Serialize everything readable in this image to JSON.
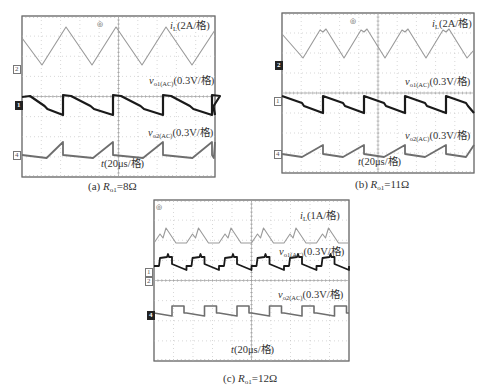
{
  "figure": {
    "panels": [
      {
        "id": "a",
        "caption_prefix": "(a) ",
        "caption_var": "R",
        "caption_sub": "o1",
        "caption_value": "=8Ω",
        "labels": {
          "iL_var": "i",
          "iL_sub": "L",
          "iL_scale": "(2A/格)",
          "vo1_var": "v",
          "vo1_sub": "o1(AC)",
          "vo1_scale": "(0.3V/格)",
          "vo2_var": "v",
          "vo2_sub": "o2(AC)",
          "vo2_scale": "(0.3V/格)",
          "time_var": "t",
          "time_scale": "(20μs/格)"
        },
        "channel_markers": [
          "2",
          "1",
          "4"
        ]
      },
      {
        "id": "b",
        "caption_prefix": "(b) ",
        "caption_var": "R",
        "caption_sub": "o1",
        "caption_value": "=11Ω",
        "labels": {
          "iL_var": "i",
          "iL_sub": "L",
          "iL_scale": "(2A/格)",
          "vo1_var": "v",
          "vo1_sub": "o1(AC)",
          "vo1_scale": "(0.3V/格)",
          "vo2_var": "v",
          "vo2_sub": "o2(AC)",
          "vo2_scale": "(0.3V/格)",
          "time_var": "t",
          "time_scale": "(20μs/格)"
        },
        "channel_markers": [
          "2",
          "1",
          "4"
        ]
      },
      {
        "id": "c",
        "caption_prefix": "(c) ",
        "caption_var": "R",
        "caption_sub": "o1",
        "caption_value": "=12Ω",
        "labels": {
          "iL_var": "i",
          "iL_sub": "L",
          "iL_scale": "(1A/格)",
          "vo1_var": "v",
          "vo1_sub": "o1(AC)",
          "vo1_scale": "(0.3V/格)",
          "vo2_var": "v",
          "vo2_sub": "o2(AC)",
          "vo2_scale": "(0.3V/格)",
          "time_var": "t",
          "time_scale": "(20μs/格)"
        },
        "channel_markers": [
          "1",
          "2",
          "4"
        ]
      }
    ],
    "colors": {
      "grid": "#bdbdbd",
      "frame": "#555555",
      "iL_trace": "#9a9a9a",
      "vo1_trace": "#1a1a1a",
      "vo2_trace": "#6e6e6e"
    }
  },
  "chart_data": [
    {
      "type": "line",
      "title": "(a) Ro1=8Ω",
      "xlabel": "t (20μs/格)",
      "grid": true,
      "divisions": {
        "x": 10,
        "y": 8
      },
      "series": [
        {
          "name": "iL (2A/格)",
          "shape": "triangle",
          "period_div": 2.6,
          "peak_to_peak_div": 1.9
        },
        {
          "name": "vo1(AC) (0.3V/格)",
          "shape": "decaying sawtooth with step reset",
          "period_div": 2.6,
          "peak_to_peak_div": 1.0
        },
        {
          "name": "vo2(AC) (0.3V/格)",
          "shape": "flat then ramp-up, step reset",
          "period_div": 2.6,
          "peak_to_peak_div": 0.7
        }
      ]
    },
    {
      "type": "line",
      "title": "(b) Ro1=11Ω",
      "xlabel": "t (20μs/格)",
      "grid": true,
      "divisions": {
        "x": 10,
        "y": 8
      },
      "series": [
        {
          "name": "iL (2A/格)",
          "shape": "triangle with notch at peak",
          "period_div": 2.1,
          "peak_to_peak_div": 1.5
        },
        {
          "name": "vo1(AC) (0.3V/格)",
          "shape": "decaying sawtooth with step reset",
          "period_div": 2.1,
          "peak_to_peak_div": 0.9
        },
        {
          "name": "vo2(AC) (0.3V/格)",
          "shape": "flat then ramp-up, step reset",
          "period_div": 2.1,
          "peak_to_peak_div": 0.7
        }
      ]
    },
    {
      "type": "line",
      "title": "(c) Ro1=12Ω",
      "xlabel": "t (20μs/格)",
      "grid": true,
      "divisions": {
        "x": 10,
        "y": 8
      },
      "series": [
        {
          "name": "iL (1A/格)",
          "shape": "double-peak triangle",
          "period_div": 1.6,
          "peak_to_peak_div": 0.9
        },
        {
          "name": "vo1(AC) (0.3V/格)",
          "shape": "step up with spike, linear decay",
          "period_div": 1.6,
          "peak_to_peak_div": 0.7
        },
        {
          "name": "vo2(AC) (0.3V/格)",
          "shape": "square-ish step with sloped low segment",
          "period_div": 1.6,
          "peak_to_peak_div": 0.5
        }
      ]
    }
  ]
}
